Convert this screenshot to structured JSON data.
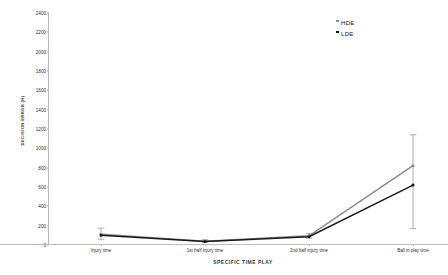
{
  "chart_data": {
    "type": "line",
    "title": "",
    "xlabel": "SPECIFIC TIME PLAY",
    "ylabel": "DECISION ERROR (H)",
    "categories": [
      "Injury time",
      "1st half injury time",
      "2nd half injury time",
      "Ball in play time"
    ],
    "ylim": [
      0,
      2400
    ],
    "yticks": [
      0,
      200,
      400,
      600,
      800,
      1000,
      1200,
      1400,
      1600,
      1800,
      2000,
      2200,
      2400
    ],
    "grid": false,
    "legend_position": "top-right",
    "series": [
      {
        "name": "HDE",
        "color": "#8a8a8a",
        "marker": "square",
        "values": [
          110,
          40,
          95,
          820
        ],
        "errors_low": [
          60,
          25,
          70,
          170
        ],
        "errors_high": [
          175,
          55,
          120,
          1140
        ]
      },
      {
        "name": "LDE",
        "color": "#1a1a1a",
        "marker": "square",
        "values": [
          100,
          35,
          85,
          620
        ],
        "errors_low": [
          55,
          20,
          60,
          170
        ],
        "errors_high": [
          165,
          50,
          110,
          1140
        ]
      }
    ]
  },
  "legend": {
    "items": [
      {
        "label": "HDE",
        "color": "#8f8f8f"
      },
      {
        "label": "LDE",
        "color": "#1c1c1c"
      }
    ]
  }
}
